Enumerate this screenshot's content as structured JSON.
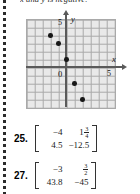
{
  "page": {
    "header_clipped_text": "x and y is negative."
  },
  "graph": {
    "axis_labels": {
      "x": "x",
      "y": "y"
    },
    "tick_labels": {
      "x_five": "5",
      "y_five": "5",
      "origin": "0"
    }
  },
  "chart_data": {
    "type": "scatter",
    "title": "",
    "xlabel": "x",
    "ylabel": "y",
    "xlim": [
      -6,
      6
    ],
    "ylim": [
      -6,
      6
    ],
    "grid": true,
    "legend": "none",
    "xticks": [
      5
    ],
    "yticks": [
      5
    ],
    "origin_label": "0",
    "points": [
      {
        "x": -2,
        "y": 4
      },
      {
        "x": -1,
        "y": 3
      },
      {
        "x": 0,
        "y": 1
      },
      {
        "x": 1,
        "y": -2
      },
      {
        "x": 2,
        "y": -4
      }
    ]
  },
  "exercises": [
    {
      "number": "25.",
      "matrix": {
        "rows": [
          [
            {
              "text": "-4"
            },
            {
              "whole": "1",
              "num": "3",
              "den": "4"
            }
          ],
          [
            {
              "text": "4.5"
            },
            {
              "text": "-12.5"
            }
          ]
        ]
      }
    },
    {
      "number": "27.",
      "matrix": {
        "rows": [
          [
            {
              "text": "-3"
            },
            {
              "whole": "",
              "num": "3",
              "den": "2"
            }
          ],
          [
            {
              "text": "43.8"
            },
            {
              "text": "-45"
            }
          ]
        ]
      }
    }
  ]
}
